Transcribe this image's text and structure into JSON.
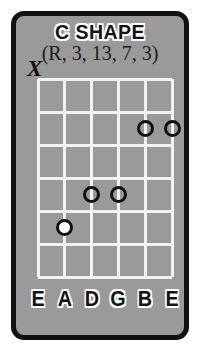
{
  "card": {
    "title": "C SHAPE",
    "subtitle": "(R, 3, 13, 7, 3)",
    "background_color": "#9a9a9a",
    "border_color": "#111111",
    "grid_color": "#f2f2f2",
    "marker_color": "#111111",
    "root_fill_color": "#ffffff"
  },
  "fretboard": {
    "string_count": 6,
    "fret_count": 6,
    "string_labels": [
      "E",
      "A",
      "D",
      "G",
      "B",
      "E"
    ],
    "mute_marker": {
      "symbol": "X",
      "string_index": 0,
      "string_label": "E"
    },
    "markers": [
      {
        "string_index": 1,
        "string_label": "A",
        "fret": 5,
        "type": "root",
        "filled": true
      },
      {
        "string_index": 2,
        "string_label": "D",
        "fret": 4,
        "type": "tone",
        "filled": false
      },
      {
        "string_index": 3,
        "string_label": "G",
        "fret": 4,
        "type": "tone",
        "filled": false
      },
      {
        "string_index": 4,
        "string_label": "B",
        "fret": 2,
        "type": "tone",
        "filled": false
      },
      {
        "string_index": 5,
        "string_label": "E",
        "fret": 2,
        "type": "tone",
        "filled": false
      }
    ],
    "intervals": [
      "R",
      "3",
      "13",
      "7",
      "3"
    ]
  }
}
